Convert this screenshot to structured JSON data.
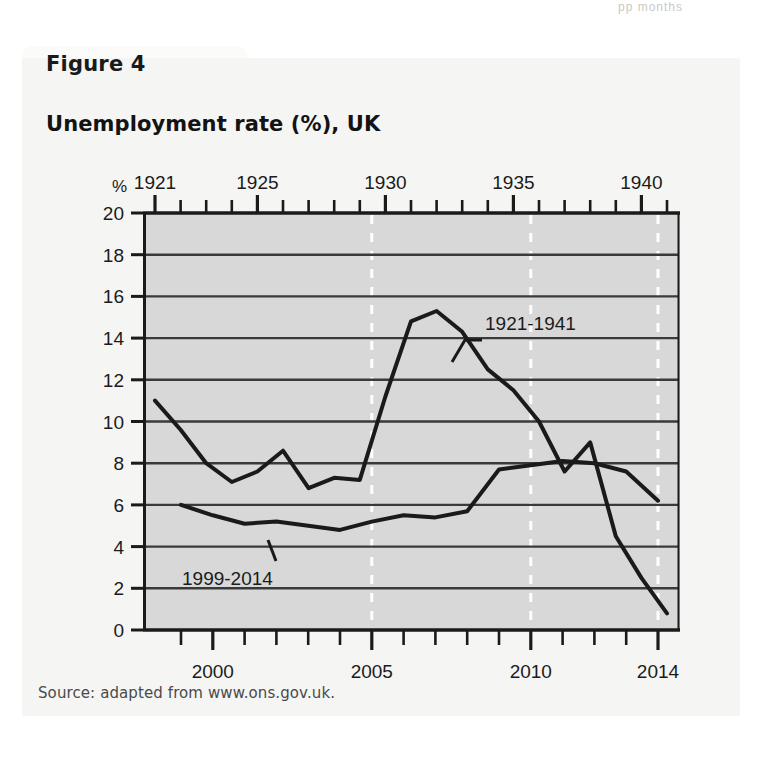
{
  "page_top_text": "pp               months",
  "figure": {
    "tab_label": "Figure 4",
    "title": "Unemployment rate (%), UK",
    "source": "Source: adapted from www.ons.gov.uk."
  },
  "chart_data": {
    "type": "line",
    "title": "Unemployment rate (%), UK",
    "xlabel": "",
    "ylabel": "%",
    "ylim": [
      0,
      20
    ],
    "ytick_labels": [
      "0",
      "2",
      "4",
      "6",
      "8",
      "10",
      "12",
      "14",
      "16",
      "18",
      "20"
    ],
    "yticks": [
      0,
      2,
      4,
      6,
      8,
      10,
      12,
      14,
      16,
      18,
      20
    ],
    "grid": "horizontal solid + vertical dashed white",
    "legend_position": "inline-annotation",
    "top_axis": {
      "label_name": "years-1921-1941",
      "tick_labels": [
        "1921",
        "1925",
        "1930",
        "1935",
        "1940"
      ],
      "tick_values": [
        1921,
        1925,
        1930,
        1935,
        1940
      ],
      "range": [
        1921,
        1941
      ]
    },
    "bottom_axis": {
      "label_name": "years-1999-2014",
      "tick_labels": [
        "2000",
        "2005",
        "2010",
        "2014"
      ],
      "tick_values": [
        2000,
        2005,
        2010,
        2014
      ],
      "range": [
        1999,
        2014
      ]
    },
    "series": [
      {
        "name": "1921-1941",
        "annotation": "1921-1941",
        "axis": "top",
        "x": [
          1921,
          1922,
          1923,
          1924,
          1925,
          1926,
          1927,
          1928,
          1929,
          1930,
          1931,
          1932,
          1933,
          1934,
          1935,
          1936,
          1937,
          1938,
          1939,
          1940,
          1941
        ],
        "values": [
          11.0,
          9.6,
          8.0,
          7.1,
          7.6,
          8.6,
          6.8,
          7.3,
          7.2,
          11.2,
          14.8,
          15.3,
          14.3,
          12.5,
          11.5,
          10.0,
          7.6,
          9.0,
          4.5,
          2.5,
          0.8
        ]
      },
      {
        "name": "1999-2014",
        "annotation": "1999-2014",
        "axis": "bottom",
        "x": [
          1999,
          2000,
          2001,
          2002,
          2003,
          2004,
          2005,
          2006,
          2007,
          2008,
          2009,
          2010,
          2011,
          2012,
          2013,
          2014
        ],
        "values": [
          6.0,
          5.5,
          5.1,
          5.2,
          5.0,
          4.8,
          5.2,
          5.5,
          5.4,
          5.7,
          7.7,
          7.9,
          8.1,
          8.0,
          7.6,
          6.2
        ]
      }
    ]
  },
  "colors": {
    "plot_background": "#d8d8d8",
    "card_background": "#f5f5f3",
    "line": "#1a1a1a",
    "gridline": "#3a3a3a",
    "vertical_gridline": "#ffffff"
  }
}
